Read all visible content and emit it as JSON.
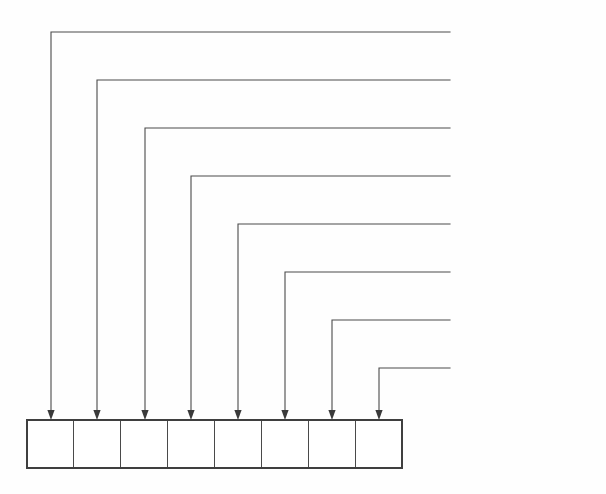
{
  "figure": {
    "type": "bit-field-callout-diagram",
    "background_color": "#fefefe",
    "line_color": "#4a4a4a",
    "text_color": "#2b2b2b"
  },
  "bitfield": {
    "name": "attribute-byte",
    "cell_count": 8,
    "cells": [
      "",
      "",
      "",
      "",
      "",
      "",
      "",
      ""
    ],
    "box": {
      "x": 27,
      "y": 420,
      "width": 375,
      "height": 48
    }
  },
  "callouts": [
    {
      "label": "(reserved, 0)",
      "line_y": 32,
      "drop_x": 51,
      "bit_index": 0
    },
    {
      "label": "(reserved, 0)",
      "line_y": 80,
      "drop_x": 97,
      "bit_index": 1
    },
    {
      "label": "archive bit",
      "line_y": 128,
      "drop_x": 145,
      "bit_index": 2
    },
    {
      "label": "subdirectory",
      "line_y": 176,
      "drop_x": 191,
      "bit_index": 3
    },
    {
      "label": "volume label",
      "line_y": 224,
      "drop_x": 238,
      "bit_index": 4
    },
    {
      "label": "system file",
      "line_y": 272,
      "drop_x": 285,
      "bit_index": 5
    },
    {
      "label": "hidden file",
      "line_y": 320,
      "drop_x": 332,
      "bit_index": 6
    },
    {
      "label": "read-only file",
      "line_y": 368,
      "drop_x": 379,
      "bit_index": 7
    }
  ],
  "geometry": {
    "label_x": 455,
    "line_right_x": 450,
    "arrow_tip_y": 420,
    "arrow_half_width": 3.6,
    "arrow_height": 10
  }
}
